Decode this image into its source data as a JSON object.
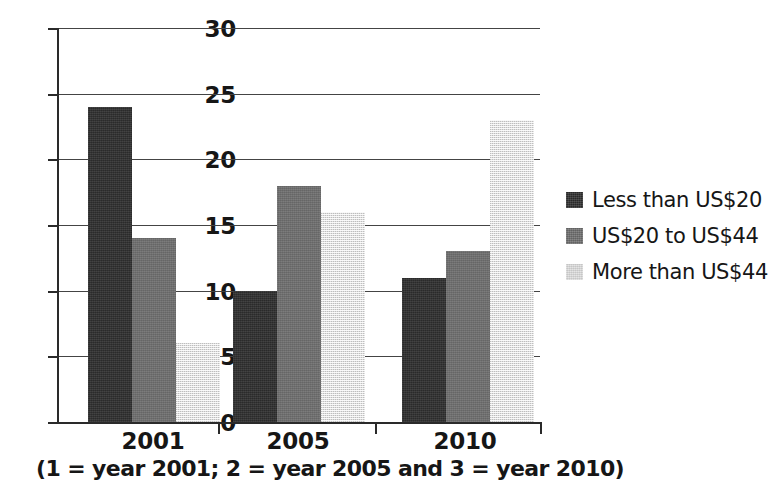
{
  "chart_data": {
    "type": "bar",
    "title": "",
    "subtitle": "",
    "xlabel": "",
    "ylabel": "",
    "categories": [
      "2001",
      "2005",
      "2010"
    ],
    "series": [
      {
        "name": "Less than US$20",
        "values": [
          24,
          10,
          11
        ],
        "color": "#2e2e2e"
      },
      {
        "name": "US$20 to US$44",
        "values": [
          14,
          18,
          13
        ],
        "color": "#6e6e6e"
      },
      {
        "name": "More than US$44",
        "values": [
          6,
          16,
          23
        ],
        "color": "#e0e0e0"
      }
    ],
    "ylim": [
      0,
      30
    ],
    "ytick_values": [
      30,
      25,
      20,
      15,
      10,
      5,
      0
    ],
    "ytick_labels": [
      "30",
      "25",
      "20",
      "15",
      "10",
      "5",
      "0"
    ],
    "grid": true,
    "grid_axis": "y",
    "legend_position": "right",
    "caption": "(1 = year 2001; 2 = year 2005 and 3 = year 2010)",
    "annotations": []
  },
  "axis": {
    "y": {
      "labels": [
        "30",
        "25",
        "20",
        "15",
        "10",
        "5",
        "0"
      ]
    },
    "x": {
      "labels": [
        "2001",
        "2005",
        "2010"
      ]
    }
  },
  "legend": {
    "items": [
      {
        "label": "Less than US$20",
        "swatch": "dark"
      },
      {
        "label": "US$20 to US$44",
        "swatch": "medium"
      },
      {
        "label": "More than US$44",
        "swatch": "light"
      }
    ]
  },
  "caption": {
    "text": "(1 = year 2001; 2 = year 2005 and 3 = year 2010)"
  }
}
